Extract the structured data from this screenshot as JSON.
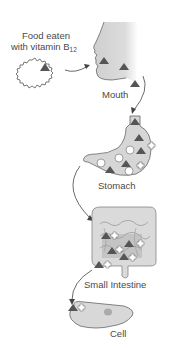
{
  "diagram": {
    "type": "vitamin B12 digestion pathway",
    "stages": [
      {
        "id": "food",
        "label_line1": "Food eaten",
        "label_line2": "with vitamin B",
        "label_sub": "12"
      },
      {
        "id": "mouth",
        "label": "Mouth"
      },
      {
        "id": "stomach",
        "label": "Stomach"
      },
      {
        "id": "small-intestine",
        "label": "Small Intestine"
      },
      {
        "id": "cell",
        "label": "Cell"
      }
    ],
    "symbols": {
      "triangle": "vitamin B12 (dark triangle)",
      "circle": "white circle",
      "cross": "white cross"
    },
    "colors": {
      "organ_fill": "#d8d8d8",
      "triangle": "#555555",
      "outline": "#666666"
    }
  }
}
